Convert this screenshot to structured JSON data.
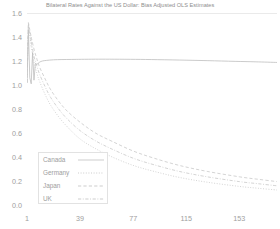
{
  "chart_data": {
    "type": "line",
    "title": "Bilateral Rates Against the US Dollar: Bias Adjusted OLS Estimates",
    "xlabel": "",
    "ylabel": "",
    "xlim": [
      1,
      180
    ],
    "ylim": [
      0.0,
      1.6
    ],
    "grid": false,
    "legend_position": "bottom-left-inside",
    "x_tick_labels": [
      "1",
      "39",
      "77",
      "115",
      "153"
    ],
    "x_tick_values": [
      1,
      39,
      77,
      115,
      153
    ],
    "y_tick_labels": [
      "0.0",
      "0.2",
      "0.4",
      "0.6",
      "0.8",
      "1.0",
      "1.2",
      "1.4",
      "1.6"
    ],
    "y_tick_values": [
      0.0,
      0.2,
      0.4,
      0.6,
      0.8,
      1.0,
      1.2,
      1.4,
      1.6
    ],
    "series": [
      {
        "name": "Canada",
        "linestyle": "solid",
        "color": "#b9b9b9",
        "x": [
          1,
          2,
          3,
          4,
          5,
          6,
          7,
          8,
          10,
          12,
          15,
          20,
          26,
          33,
          40,
          50,
          60,
          75,
          90,
          110,
          130,
          150,
          165,
          180
        ],
        "values": [
          1.02,
          1.46,
          1.06,
          1.01,
          1.27,
          1.04,
          1.18,
          1.17,
          1.19,
          1.2,
          1.205,
          1.21,
          1.212,
          1.213,
          1.214,
          1.215,
          1.215,
          1.214,
          1.212,
          1.208,
          1.203,
          1.197,
          1.193,
          1.188
        ]
      },
      {
        "name": "Germany",
        "linestyle": "dotted",
        "color": "#c5c5c5",
        "x": [
          1,
          2,
          4,
          6,
          8,
          10,
          14,
          18,
          24,
          30,
          39,
          50,
          62,
          77,
          92,
          110,
          130,
          153,
          166,
          180
        ],
        "values": [
          1.02,
          1.5,
          1.32,
          1.19,
          1.1,
          1.03,
          0.92,
          0.83,
          0.73,
          0.65,
          0.55,
          0.47,
          0.4,
          0.33,
          0.28,
          0.23,
          0.19,
          0.155,
          0.14,
          0.125
        ]
      },
      {
        "name": "Japan",
        "linestyle": "dashed",
        "color": "#c5c5c5",
        "x": [
          1,
          2,
          4,
          6,
          8,
          10,
          14,
          18,
          24,
          30,
          39,
          50,
          62,
          77,
          92,
          110,
          130,
          153,
          166,
          180
        ],
        "values": [
          1.02,
          1.52,
          1.4,
          1.3,
          1.22,
          1.15,
          1.05,
          0.96,
          0.86,
          0.78,
          0.69,
          0.6,
          0.53,
          0.45,
          0.39,
          0.33,
          0.28,
          0.235,
          0.215,
          0.195
        ]
      },
      {
        "name": "UK",
        "linestyle": "dashdot",
        "color": "#c5c5c5",
        "x": [
          1,
          2,
          4,
          6,
          8,
          10,
          14,
          18,
          24,
          30,
          39,
          50,
          62,
          77,
          92,
          110,
          130,
          153,
          166,
          180
        ],
        "values": [
          1.02,
          1.51,
          1.36,
          1.24,
          1.16,
          1.09,
          0.985,
          0.895,
          0.795,
          0.715,
          0.62,
          0.535,
          0.465,
          0.39,
          0.335,
          0.28,
          0.235,
          0.195,
          0.178,
          0.16
        ]
      }
    ],
    "legend": [
      {
        "label": "Canada",
        "linestyle": "solid"
      },
      {
        "label": "Germany",
        "linestyle": "dotted"
      },
      {
        "label": "Japan",
        "linestyle": "dashed"
      },
      {
        "label": "UK",
        "linestyle": "dashdot"
      }
    ],
    "colors": {
      "background": "#ffffff",
      "axis_text": "#9e9e9e",
      "title_text": "#8d8d8d",
      "line": "#c0c0c0",
      "legend_border": "#e2e2e2",
      "frame": "#dcdcdc"
    }
  }
}
